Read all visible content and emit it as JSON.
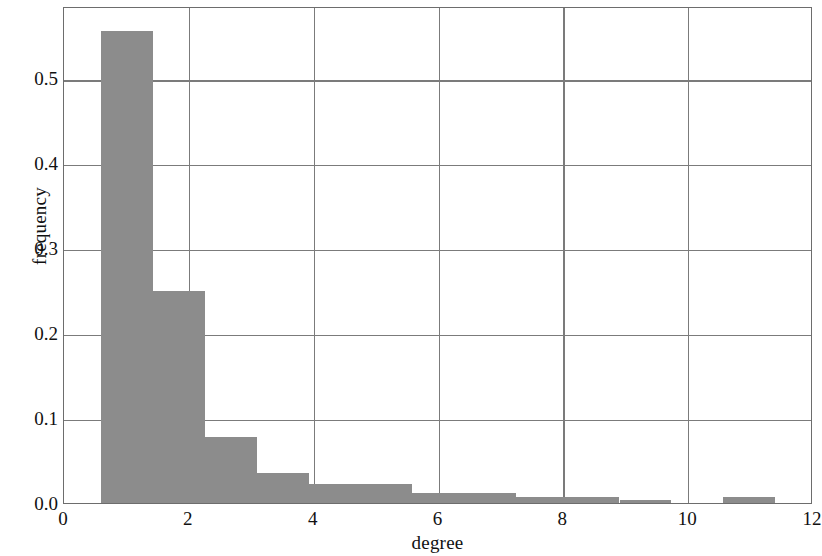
{
  "chart_data": {
    "type": "bar",
    "title": "",
    "subtitle": "",
    "xlabel": "degree",
    "ylabel": "frequency",
    "xlim": [
      0,
      12
    ],
    "ylim": [
      0.0,
      0.585
    ],
    "xticks": [
      0,
      2,
      4,
      6,
      8,
      10,
      12
    ],
    "xtick_labels": [
      "0",
      "2",
      "4",
      "6",
      "8",
      "10",
      "12"
    ],
    "yticks": [
      0.0,
      0.1,
      0.2,
      0.3,
      0.4,
      0.5
    ],
    "ytick_labels": [
      "0.0",
      "0.1",
      "0.2",
      "0.3",
      "0.4",
      "0.5"
    ],
    "grid": true,
    "grid_axis": "both",
    "legend": false,
    "bar_color": "#8c8c8c",
    "frame_color": "#6d6d6d",
    "grid_color": "#7b7b7b",
    "bin_edges": [
      0.6,
      1.43,
      2.26,
      3.09,
      3.92,
      4.75,
      5.58,
      6.41,
      7.24,
      8.07,
      8.9,
      9.73,
      10.56,
      11.39
    ],
    "bins": [
      {
        "x0": 0.6,
        "x1": 1.43,
        "value": 0.556
      },
      {
        "x0": 1.43,
        "x1": 2.26,
        "value": 0.249
      },
      {
        "x0": 2.26,
        "x1": 3.09,
        "value": 0.078
      },
      {
        "x0": 3.09,
        "x1": 3.92,
        "value": 0.035
      },
      {
        "x0": 3.92,
        "x1": 4.75,
        "value": 0.022
      },
      {
        "x0": 4.75,
        "x1": 5.58,
        "value": 0.022
      },
      {
        "x0": 5.58,
        "x1": 6.41,
        "value": 0.012
      },
      {
        "x0": 6.41,
        "x1": 7.24,
        "value": 0.012
      },
      {
        "x0": 7.24,
        "x1": 8.07,
        "value": 0.007
      },
      {
        "x0": 8.07,
        "x1": 8.9,
        "value": 0.007
      },
      {
        "x0": 8.9,
        "x1": 9.73,
        "value": 0.004
      },
      {
        "x0": 9.73,
        "x1": 10.56,
        "value": 0.0
      },
      {
        "x0": 10.56,
        "x1": 11.39,
        "value": 0.007
      }
    ],
    "categories": [
      "0.6-1.43",
      "1.43-2.26",
      "2.26-3.09",
      "3.09-3.92",
      "3.92-4.75",
      "4.75-5.58",
      "5.58-6.41",
      "6.41-7.24",
      "7.24-8.07",
      "8.07-8.9",
      "8.9-9.73",
      "9.73-10.56",
      "10.56-11.39"
    ],
    "values": [
      0.556,
      0.249,
      0.078,
      0.035,
      0.022,
      0.022,
      0.012,
      0.012,
      0.007,
      0.007,
      0.004,
      0.0,
      0.007
    ]
  }
}
